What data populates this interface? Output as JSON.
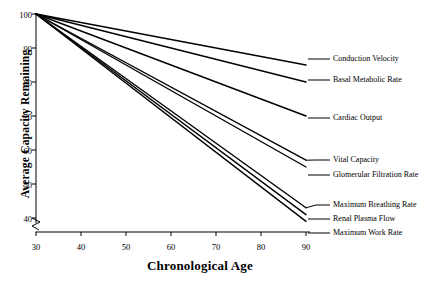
{
  "chart_data": {
    "type": "line",
    "title": "",
    "xlabel": "Chronological Age",
    "ylabel": "Average Capacity Remaining",
    "xlim": [
      30,
      90
    ],
    "ylim": [
      38,
      100
    ],
    "xticks": [
      30,
      40,
      50,
      60,
      70,
      80,
      90
    ],
    "yticks": [
      40,
      50,
      60,
      70,
      80,
      90,
      100
    ],
    "grid": false,
    "legend": "inline-right-leader-labels",
    "axis_break": "y-axis break below 40 at origin",
    "x": [
      30,
      90
    ],
    "series": [
      {
        "name": "Conduction Velocity",
        "values": [
          100,
          85
        ]
      },
      {
        "name": "Basal Metabolic Rate",
        "values": [
          100,
          80
        ]
      },
      {
        "name": "Cardiac Output",
        "values": [
          100,
          70
        ]
      },
      {
        "name": "Vital Capacity",
        "values": [
          100,
          57
        ]
      },
      {
        "name": "Glomerular Filtration Rate",
        "values": [
          100,
          55
        ]
      },
      {
        "name": "Maximum Breathing Rate",
        "values": [
          100,
          43
        ]
      },
      {
        "name": "Renal Plasma Flow",
        "values": [
          100,
          41
        ]
      },
      {
        "name": "Maximum Work Rate",
        "values": [
          100,
          39
        ]
      }
    ]
  },
  "axis": {
    "y_tick_labels": [
      "100",
      "90",
      "80",
      "70",
      "60",
      "50",
      "40"
    ],
    "x_tick_labels": [
      "30",
      "40",
      "50",
      "60",
      "70",
      "80",
      "90"
    ]
  },
  "labels": {
    "conduction_velocity": "Conduction Velocity",
    "basal_metabolic_rate": "Basal Metabolic Rate",
    "cardiac_output": "Cardiac Output",
    "vital_capacity": "Vital Capacity",
    "glomerular_filtration_rate": "Glomerular Filtration Rate",
    "maximum_breathing_rate": "Maximum Breathing Rate",
    "renal_plasma_flow": "Renal Plasma Flow",
    "maximum_work_rate": "Maximum Work Rate"
  },
  "colors": {
    "line": "#000000",
    "axis": "#000000",
    "background": "#ffffff"
  }
}
